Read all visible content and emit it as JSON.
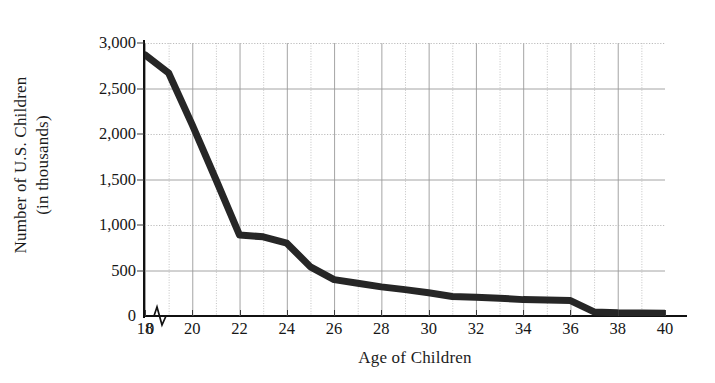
{
  "chart_data": {
    "type": "line",
    "title": "",
    "xlabel": "Age of Children",
    "ylabel_line1": "Number of U.S. Children",
    "ylabel_line2": "(in thousands)",
    "xlim": [
      18,
      40
    ],
    "ylim": [
      0,
      3000
    ],
    "grid": true,
    "legend": "none",
    "axis_break_x": true,
    "origin_tick_label": "0",
    "x_tick_labels": [
      "0",
      "18",
      "20",
      "22",
      "24",
      "26",
      "28",
      "30",
      "32",
      "34",
      "36",
      "38",
      "40"
    ],
    "x_tick_values": [
      18,
      20,
      22,
      24,
      26,
      28,
      30,
      32,
      34,
      36,
      38,
      40
    ],
    "x_minor_step": 1,
    "y_tick_labels": [
      "0",
      "500",
      "1,000",
      "1,500",
      "2,000",
      "2,500",
      "3,000"
    ],
    "y_tick_values": [
      0,
      500,
      1000,
      1500,
      2000,
      2500,
      3000
    ],
    "series": [
      {
        "name": "Number of U.S. Children",
        "color": "#262626",
        "line_width": 7,
        "x": [
          18,
          19,
          20,
          21,
          22,
          23,
          24,
          25,
          26,
          27,
          28,
          29,
          30,
          31,
          32,
          33,
          34,
          35,
          36,
          37,
          38,
          39,
          40
        ],
        "values": [
          2870,
          2670,
          2100,
          1500,
          890,
          870,
          800,
          540,
          400,
          360,
          320,
          290,
          255,
          215,
          205,
          195,
          180,
          175,
          170,
          45,
          35,
          32,
          30
        ]
      }
    ]
  },
  "axes": {
    "x_label": "Age of Children",
    "y_label_top": "Number of U.S. Children",
    "y_label_bottom": "(in thousands)"
  },
  "colors": {
    "line": "#262626",
    "grid_major": "#9a9a9a",
    "grid_dotted": "#b4b4b4",
    "axis": "#111111",
    "text": "#161616",
    "background": "#ffffff"
  }
}
